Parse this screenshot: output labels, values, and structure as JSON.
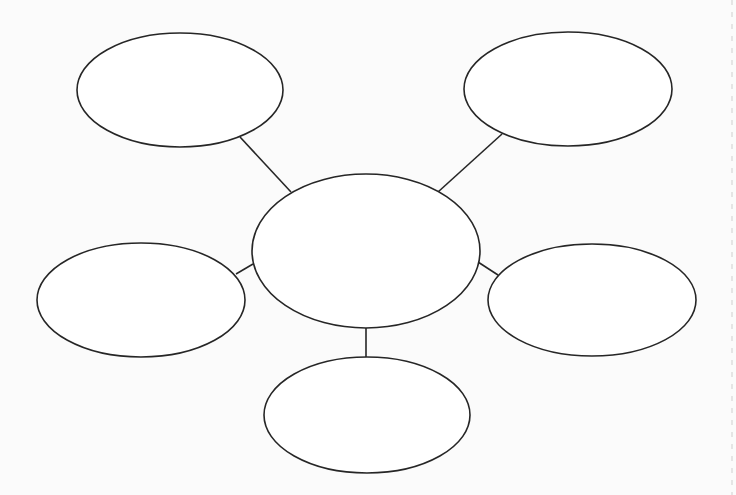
{
  "diagram": {
    "type": "spider-map",
    "background": "#fbfbfb",
    "stroke_color": "#262626",
    "nodes": [
      {
        "id": "center",
        "role": "central-topic",
        "cx": 366,
        "cy": 251,
        "rx": 114,
        "ry": 77,
        "label": ""
      },
      {
        "id": "top-left",
        "role": "branch",
        "cx": 180,
        "cy": 90,
        "rx": 103,
        "ry": 57,
        "label": ""
      },
      {
        "id": "top-right",
        "role": "branch",
        "cx": 568,
        "cy": 89,
        "rx": 104,
        "ry": 57,
        "label": ""
      },
      {
        "id": "left",
        "role": "branch",
        "cx": 141,
        "cy": 300,
        "rx": 104,
        "ry": 57,
        "label": ""
      },
      {
        "id": "right",
        "role": "branch",
        "cx": 592,
        "cy": 300,
        "rx": 104,
        "ry": 56,
        "label": ""
      },
      {
        "id": "bottom",
        "role": "branch",
        "cx": 367,
        "cy": 415,
        "rx": 103,
        "ry": 58,
        "label": ""
      }
    ],
    "edges": [
      {
        "from": "center",
        "to": "top-left",
        "x1": 291,
        "y1": 192,
        "x2": 240,
        "y2": 137
      },
      {
        "from": "center",
        "to": "top-right",
        "x1": 438,
        "y1": 192,
        "x2": 502,
        "y2": 134
      },
      {
        "from": "center",
        "to": "left",
        "x1": 253,
        "y1": 264,
        "x2": 236,
        "y2": 274
      },
      {
        "from": "center",
        "to": "right",
        "x1": 478,
        "y1": 262,
        "x2": 498,
        "y2": 275
      },
      {
        "from": "center",
        "to": "bottom",
        "x1": 366,
        "y1": 328,
        "x2": 366,
        "y2": 357
      }
    ],
    "margin_line": {
      "x": 732,
      "y1": 0,
      "y2": 495
    }
  }
}
